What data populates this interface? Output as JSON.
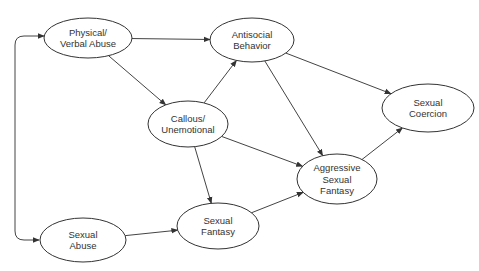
{
  "diagram": {
    "type": "path-model",
    "colors": {
      "stroke": "#333333",
      "text": "#333333",
      "background": "#ffffff"
    },
    "nodes": [
      {
        "id": "pva",
        "lines": [
          "Physical/",
          "Verbal Abuse"
        ],
        "cx": 88,
        "cy": 38,
        "rx": 44,
        "ry": 20
      },
      {
        "id": "asb",
        "lines": [
          "Antisocial",
          "Behavior"
        ],
        "cx": 252,
        "cy": 40,
        "rx": 42,
        "ry": 22
      },
      {
        "id": "cu",
        "lines": [
          "Callous/",
          "Unemotional"
        ],
        "cx": 188,
        "cy": 124,
        "rx": 40,
        "ry": 23
      },
      {
        "id": "sc",
        "lines": [
          "Sexual",
          "Coercion"
        ],
        "cx": 428,
        "cy": 108,
        "rx": 46,
        "ry": 24
      },
      {
        "id": "asf",
        "lines": [
          "Aggressive",
          "Sexual",
          "Fantasy"
        ],
        "cx": 337,
        "cy": 179,
        "rx": 40,
        "ry": 25
      },
      {
        "id": "sf",
        "lines": [
          "Sexual",
          "Fantasy"
        ],
        "cx": 218,
        "cy": 226,
        "rx": 41,
        "ry": 23
      },
      {
        "id": "sa",
        "lines": [
          "Sexual",
          "Abuse"
        ],
        "cx": 83,
        "cy": 240,
        "rx": 43,
        "ry": 22
      }
    ],
    "edges": [
      {
        "from": "pva",
        "to": "asb"
      },
      {
        "from": "pva",
        "to": "cu"
      },
      {
        "from": "cu",
        "to": "asb"
      },
      {
        "from": "asb",
        "to": "sc"
      },
      {
        "from": "asb",
        "to": "asf"
      },
      {
        "from": "cu",
        "to": "asf"
      },
      {
        "from": "cu",
        "to": "sf"
      },
      {
        "from": "sa",
        "to": "sf"
      },
      {
        "from": "sf",
        "to": "asf"
      },
      {
        "from": "asf",
        "to": "sc"
      }
    ],
    "correlation": {
      "between": [
        "pva",
        "sa"
      ],
      "style": "double-headed bracket on left"
    }
  }
}
